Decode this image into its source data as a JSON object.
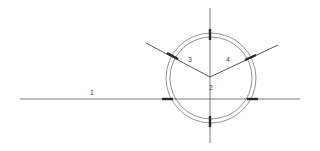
{
  "diagram": {
    "background_color": "#ffffff",
    "line_color": "#555555",
    "tick_color": "#2a2a2a",
    "label_color": "#444444",
    "labels": [
      {
        "id": "1",
        "text": "1",
        "x": 93,
        "y": 93,
        "meaning": "horizontal-baseline-label"
      },
      {
        "id": "2",
        "text": "2",
        "x": 211,
        "y": 88,
        "meaning": "vertex-angle-label"
      },
      {
        "id": "3",
        "text": "3",
        "x": 190,
        "y": 60,
        "meaning": "left-angle-label"
      },
      {
        "id": "4",
        "text": "4",
        "x": 228,
        "y": 60,
        "meaning": "right-angle-label"
      }
    ],
    "horizontal_line": {
      "x1": 20,
      "y1": 99,
      "x2": 300,
      "y2": 99
    },
    "vertical_line": {
      "x1": 210,
      "y1": 8,
      "x2": 210,
      "y2": 143
    },
    "circles": [
      {
        "id": "outer-circle",
        "cx": 211,
        "cy": 78,
        "r": 45
      },
      {
        "id": "inner-circle",
        "cx": 211,
        "cy": 78,
        "r": 41
      }
    ],
    "vertex": {
      "x": 210,
      "y": 77
    },
    "rays": [
      {
        "id": "left-ray",
        "x1": 210,
        "y1": 77,
        "x2": 146,
        "y2": 43
      },
      {
        "id": "right-ray",
        "x1": 210,
        "y1": 77,
        "x2": 278,
        "y2": 45
      }
    ],
    "tick_marks": [
      {
        "id": "tick-top",
        "cx": 210,
        "cy": 34,
        "angle": 0,
        "length": 11
      },
      {
        "id": "tick-bottom",
        "cx": 210,
        "cy": 121,
        "angle": 0,
        "length": 11
      },
      {
        "id": "tick-left",
        "cx": 167,
        "cy": 99,
        "angle": 90,
        "length": 11
      },
      {
        "id": "tick-right",
        "cx": 253,
        "cy": 99,
        "angle": 90,
        "length": 11
      },
      {
        "id": "tick-left-ray",
        "cx": 172,
        "cy": 56,
        "angle": 62,
        "length": 11
      },
      {
        "id": "tick-right-ray",
        "cx": 250,
        "cy": 58,
        "angle": 115,
        "length": 11
      }
    ]
  }
}
